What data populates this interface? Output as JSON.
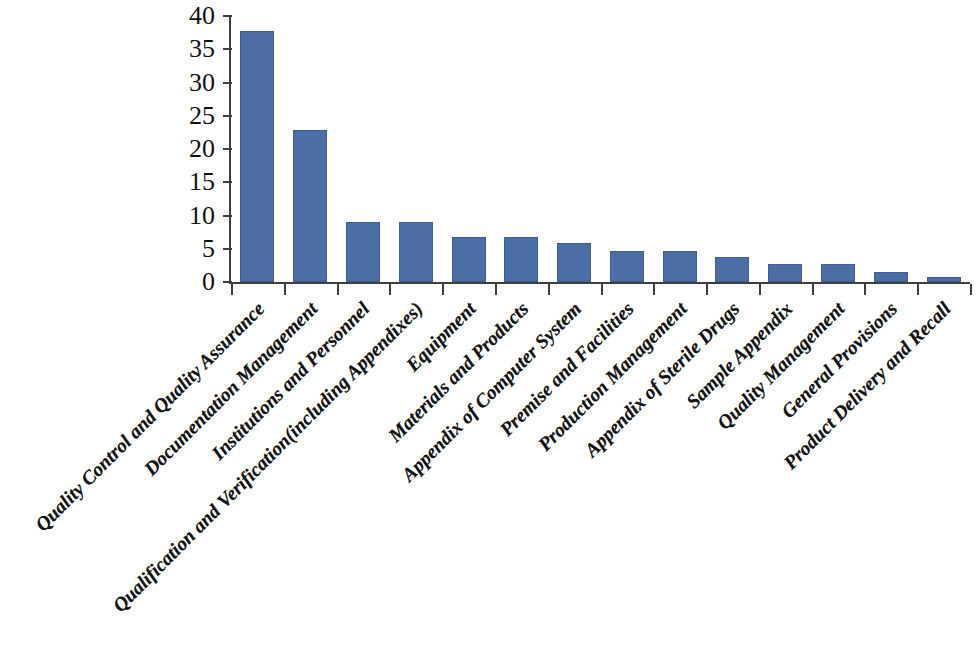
{
  "chart_data": {
    "type": "bar",
    "title": "",
    "subtitle": "",
    "xlabel": "",
    "ylabel": "",
    "ylim": [
      0,
      40
    ],
    "yticks": [
      0,
      5,
      10,
      15,
      20,
      25,
      30,
      35,
      40
    ],
    "ytick_labels": [
      "0",
      "5",
      "10",
      "15",
      "20",
      "25",
      "30",
      "35",
      "40"
    ],
    "grid": false,
    "legend": false,
    "legend_position": "none",
    "bar_color": "#4a6ea5",
    "axis_color": "#3f3f3f",
    "label_rotation_deg": 45,
    "categories": [
      "Quality Control and Quality Assurance",
      "Documentation Management",
      "Institutions and Personnel",
      "Qualification and Verification(including Appendixes)",
      "Equipment",
      "Materials and Products",
      "Appendix of Computer System",
      "Premise and Facilities",
      "Production Management",
      "Appendix of Sterile Drugs",
      "Sample Appendix",
      "Quality Management",
      "General Provisions",
      "Product Delivery and Recall"
    ],
    "values": [
      37.8,
      22.9,
      9.0,
      9.0,
      6.7,
      6.7,
      5.8,
      4.7,
      4.7,
      3.8,
      2.7,
      2.7,
      1.5,
      0.7
    ]
  }
}
